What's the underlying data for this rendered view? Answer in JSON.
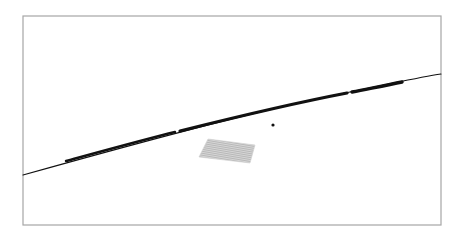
{
  "canvas": {
    "width": 468,
    "height": 237,
    "background": "#ffffff"
  },
  "frame": {
    "x": 23,
    "y": 16,
    "width": 418,
    "height": 209,
    "stroke": "#a6a6a6",
    "stroke_width": 1.2
  },
  "curve": {
    "color": "#111111",
    "thin_path": "M23,175 C120,148 250,112 350,92 C395,83 420,77 441,74",
    "thick_segments": [
      {
        "d": "M66,161 C110,149 150,138 175,132",
        "width": 2.4
      },
      {
        "d": "M180,131 C240,116 300,102 347,93",
        "width": 3.2
      },
      {
        "d": "M352,92 C372,88 388,85 402,82",
        "width": 3.4
      }
    ],
    "thin_width": 1.1
  },
  "point": {
    "cx": 273,
    "cy": 125,
    "r": 1.6,
    "color": "#111111"
  },
  "patch": {
    "points": "208,139 255,145 250,163 199,157",
    "fill": "#d3d3d3",
    "hatch_color": "#9a9a9a",
    "hatch_spacing": 2
  }
}
